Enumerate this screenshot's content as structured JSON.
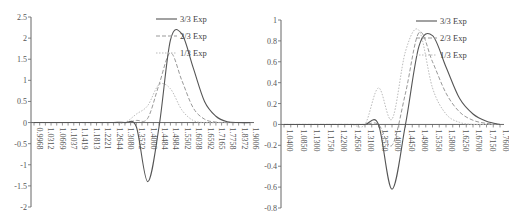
{
  "chart_data": [
    {
      "type": "line",
      "title": "",
      "xlabel": "",
      "ylabel": "",
      "ylim": [
        -2,
        2.5
      ],
      "yticks": [
        "2.5",
        "2",
        "1.5",
        "1",
        "0.5",
        "0",
        "-0.5",
        "-1",
        "-1.5",
        "-2"
      ],
      "categories": [
        "0.9968",
        "1.0312",
        "1.0669",
        "1.1037",
        "1.1419",
        "1.1813",
        "1.2221",
        "1.2644",
        "1.3080",
        "1.3532",
        "1.4000",
        "1.4484",
        "1.4984",
        "1.5502",
        "1.6038",
        "1.6592",
        "1.7165",
        "1.7758",
        "1.8372",
        "1.9006"
      ],
      "legend_position": "upper right",
      "grid": false,
      "series": [
        {
          "name": "3/3 Exp",
          "style": "solid",
          "color": "#555555",
          "values": [
            0,
            0,
            0,
            0,
            0,
            0,
            0,
            0,
            0,
            -0.1,
            -1.4,
            -0.1,
            1.95,
            2.1,
            1.3,
            0.5,
            0.15,
            0.02,
            0,
            0
          ]
        },
        {
          "name": "2/3 Exp",
          "style": "dashed",
          "color": "#999999",
          "values": [
            0,
            0,
            0,
            0,
            0,
            0,
            0,
            0,
            0,
            0.05,
            0.1,
            0.9,
            1.65,
            1.0,
            0.35,
            0.08,
            0.01,
            0,
            0,
            0
          ]
        },
        {
          "name": "1/3 Exp",
          "style": "dotted",
          "color": "#bbbbbb",
          "values": [
            0,
            0,
            0,
            0,
            0,
            0,
            0,
            0,
            0,
            0.2,
            0.4,
            0.9,
            0.8,
            0.3,
            0.05,
            0,
            0,
            0,
            0,
            0
          ]
        }
      ]
    },
    {
      "type": "line",
      "title": "",
      "xlabel": "",
      "ylabel": "",
      "ylim": [
        -0.8,
        1
      ],
      "yticks": [
        "1",
        "0.8",
        "0.6",
        "0.4",
        "0.2",
        "0",
        "-0.2",
        "-0.4",
        "-0.6",
        "-0.8"
      ],
      "categories": [
        "1.0400",
        "1.0850",
        "1.1300",
        "1.1750",
        "1.2200",
        "1.2650",
        "1.3100",
        "1.3550",
        "1.4000",
        "1.4450",
        "1.4900",
        "1.5350",
        "1.5800",
        "1.6250",
        "1.6700",
        "1.7150",
        "1.7600"
      ],
      "legend_position": "upper right",
      "grid": false,
      "series": [
        {
          "name": "3/3 Exp",
          "style": "solid",
          "color": "#555555",
          "values": [
            0,
            0,
            0,
            0,
            0,
            0,
            0,
            0,
            -0.62,
            0.0,
            0.75,
            0.85,
            0.55,
            0.25,
            0.1,
            0.03,
            0
          ]
        },
        {
          "name": "2/3 Exp",
          "style": "dashed",
          "color": "#999999",
          "values": [
            0,
            0,
            0,
            0,
            0,
            0,
            0,
            0,
            -0.2,
            0.3,
            0.88,
            0.6,
            0.3,
            0.12,
            0.04,
            0.01,
            0
          ]
        },
        {
          "name": "1/3 Exp",
          "style": "dotted",
          "color": "#bbbbbb",
          "values": [
            0,
            0,
            0,
            0,
            0,
            0,
            0,
            0.35,
            0.05,
            0.7,
            0.9,
            0.35,
            0.1,
            0.02,
            0,
            0,
            0
          ]
        }
      ]
    }
  ]
}
